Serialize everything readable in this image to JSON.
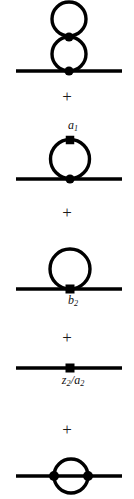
{
  "figure": {
    "background_color": "#ffffff",
    "ink_color": "#000000",
    "width": 134,
    "height": 499,
    "operators": [
      {
        "symbol": "+",
        "x_center": 67,
        "y_center": 96
      },
      {
        "symbol": "+",
        "x_center": 67,
        "y_center": 212
      },
      {
        "symbol": "+",
        "x_center": 67,
        "y_center": 337
      },
      {
        "symbol": "+",
        "x_center": 67,
        "y_center": 429
      }
    ],
    "labels": [
      {
        "id": "a1",
        "base": "a",
        "sub": "1",
        "x_center": 70,
        "y_top": 119
      },
      {
        "id": "b2",
        "base": "b",
        "sub": "2",
        "x_center": 70,
        "y_top": 294
      },
      {
        "id": "z2_over_a2",
        "numerator_base": "z",
        "numerator_sub": "2",
        "slash": "/",
        "denominator_base": "a",
        "denominator_sub": "2",
        "x_center": 70,
        "y_top": 374
      }
    ],
    "diagrams": [
      {
        "id": "double-tadpole",
        "name": "double-tadpole-diagram",
        "description": "Two stacked loops on a propagator line",
        "propagator": {
          "x1": 16,
          "x2": 122,
          "y": 71
        },
        "loops": [
          {
            "cx": 69,
            "cy": 19,
            "r": 17
          },
          {
            "cx": 69,
            "cy": 54,
            "r": 17
          }
        ],
        "vertices": [
          {
            "shape": "dot",
            "cx": 69,
            "cy": 37,
            "r": 4.6
          },
          {
            "shape": "dot",
            "cx": 69,
            "cy": 71,
            "r": 4.6
          }
        ]
      },
      {
        "id": "tadpole-a1",
        "name": "tadpole-with-a1-insertion-diagram",
        "description": "Single loop with square counterterm vertex at top labelled a_1",
        "propagator": {
          "x1": 16,
          "x2": 122,
          "y": 179
        },
        "loops": [
          {
            "cx": 70,
            "cy": 159,
            "r": 19.5
          }
        ],
        "vertices": [
          {
            "shape": "square",
            "cx": 70,
            "cy": 140,
            "size": 8.5
          },
          {
            "shape": "dot",
            "cx": 70,
            "cy": 179,
            "r": 4.6
          }
        ]
      },
      {
        "id": "tadpole-b2",
        "name": "tadpole-with-b2-vertex-diagram",
        "description": "Single loop sitting on the line with a square vertex labelled b_2",
        "propagator": {
          "x1": 16,
          "x2": 122,
          "y": 289
        },
        "loops": [
          {
            "cx": 70,
            "cy": 269,
            "r": 20
          }
        ],
        "vertices": [
          {
            "shape": "square",
            "cx": 70,
            "cy": 289,
            "size": 9
          }
        ]
      },
      {
        "id": "counterterm-z2-a2",
        "name": "counterterm-insertion-diagram",
        "description": "Bare propagator with a single square counterterm insertion labelled z_2/a_2",
        "propagator": {
          "x1": 16,
          "x2": 122,
          "y": 368
        },
        "loops": [],
        "vertices": [
          {
            "shape": "square",
            "cx": 70,
            "cy": 368,
            "size": 9
          }
        ]
      },
      {
        "id": "sunset",
        "name": "sunset-diagram",
        "description": "Circle bisected by the propagator line with dots at both intersections",
        "propagator": {
          "x1": 16,
          "x2": 122,
          "y": 476
        },
        "loops": [
          {
            "cx": 71,
            "cy": 476,
            "r": 17
          }
        ],
        "vertices": [
          {
            "shape": "dot",
            "cx": 54,
            "cy": 476,
            "r": 5
          },
          {
            "shape": "dot",
            "cx": 88,
            "cy": 476,
            "r": 5
          }
        ]
      }
    ]
  }
}
